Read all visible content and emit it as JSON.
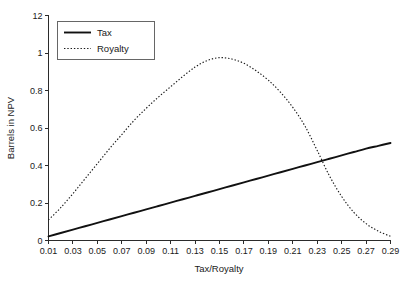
{
  "chart_data": {
    "type": "line",
    "title": "",
    "xlabel": "Tax/Royalty",
    "ylabel": "Barrels in NPV",
    "xlim": [
      0.01,
      0.29
    ],
    "ylim": [
      0,
      1.2
    ],
    "grid": false,
    "legend_position": "top-left",
    "x_ticks": [
      "0.01",
      "0.03",
      "0.05",
      "0.07",
      "0.09",
      "0.11",
      "0.13",
      "0.15",
      "0.17",
      "0.19",
      "0.21",
      "0.23",
      "0.25",
      "0.27",
      "0.29"
    ],
    "x_tick_values": [
      0.01,
      0.03,
      0.05,
      0.07,
      0.09,
      0.11,
      0.13,
      0.15,
      0.17,
      0.19,
      0.21,
      0.23,
      0.25,
      0.27,
      0.29
    ],
    "y_ticks": [
      "0",
      "0.2",
      "0.4",
      "0.6",
      "0.8",
      "1",
      "12"
    ],
    "y_tick_values": [
      0,
      0.2,
      0.4,
      0.6,
      0.8,
      1.0,
      1.2
    ],
    "x": [
      0.01,
      0.02,
      0.03,
      0.04,
      0.05,
      0.06,
      0.07,
      0.08,
      0.09,
      0.1,
      0.11,
      0.12,
      0.13,
      0.14,
      0.15,
      0.16,
      0.17,
      0.18,
      0.19,
      0.2,
      0.21,
      0.22,
      0.23,
      0.24,
      0.25,
      0.26,
      0.27,
      0.28,
      0.29
    ],
    "series": [
      {
        "name": "Tax",
        "style": "solid",
        "color": "#111111",
        "values": [
          0.022,
          0.04,
          0.058,
          0.076,
          0.094,
          0.112,
          0.13,
          0.148,
          0.166,
          0.184,
          0.202,
          0.22,
          0.238,
          0.256,
          0.274,
          0.292,
          0.31,
          0.328,
          0.346,
          0.364,
          0.382,
          0.4,
          0.418,
          0.436,
          0.454,
          0.472,
          0.49,
          0.505,
          0.52
        ]
      },
      {
        "name": "Royalty",
        "style": "dotted",
        "color": "#1a1a1a",
        "values": [
          0.11,
          0.175,
          0.25,
          0.33,
          0.41,
          0.49,
          0.565,
          0.64,
          0.705,
          0.765,
          0.82,
          0.875,
          0.925,
          0.96,
          0.975,
          0.968,
          0.945,
          0.905,
          0.855,
          0.79,
          0.71,
          0.61,
          0.48,
          0.345,
          0.235,
          0.15,
          0.09,
          0.05,
          0.022
        ]
      }
    ],
    "legend": [
      {
        "label": "Tax",
        "style": "solid"
      },
      {
        "label": "Royalty",
        "style": "dotted"
      }
    ]
  }
}
